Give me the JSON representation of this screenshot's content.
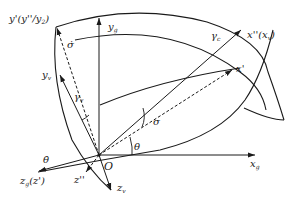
{
  "diagram": {
    "origin": "O",
    "axes": {
      "yg": {
        "main": "y",
        "sub": "g"
      },
      "xg": {
        "main": "x",
        "sub": "g"
      },
      "zg": {
        "main": "z",
        "sub": "g",
        "suffix": "(z')"
      },
      "yprime": {
        "text": "y'(y''/y",
        "sub": "2",
        "suffix": ")"
      },
      "yv": {
        "main": "y",
        "sub": "v"
      },
      "xdd": {
        "text": "x''(x",
        "sub": "v",
        "suffix": ")"
      },
      "xprime": {
        "text": "x'"
      },
      "zdd": {
        "text": "z''"
      },
      "zv": {
        "main": "z",
        "sub": "v"
      }
    },
    "angles": {
      "theta": "θ",
      "sigma": "σ",
      "gamma_v": {
        "main": "γ",
        "sub": "v"
      },
      "gamma_c": {
        "main": "γ",
        "sub": "c"
      },
      "sigma_dot": "σ̇",
      "theta_dot": "θ̇"
    },
    "colors": {
      "ink": "#1a1a1a"
    }
  }
}
